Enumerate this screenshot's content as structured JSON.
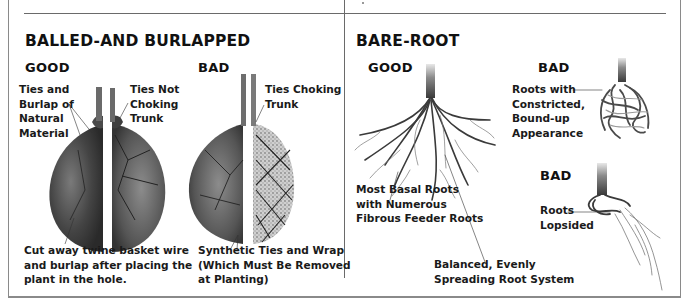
{
  "balled_and_burlapped": {
    "title": "BALLED-AND BURLAPPED",
    "good": {
      "heading": "GOOD",
      "label_natural": "Ties and\nBurlap of\nNatural\nMaterial",
      "label_not_choking": "Ties Not\nChoking\nTrunk",
      "instruction": "Cut away twine basket wire\nand burlap after placing the\nplant in the hole."
    },
    "bad": {
      "heading": "BAD",
      "label_choking": "Ties Choking\nTrunk",
      "label_synthetic": "Synthetic Ties and Wrap\n(Which Must Be Removed\nat Planting)"
    }
  },
  "bare_root": {
    "title": "BARE-ROOT",
    "good": {
      "heading": "GOOD",
      "label_basal": "Most Basal Roots\nwith Numerous\nFibrous Feeder Roots",
      "label_balanced": "Balanced, Evenly\nSpreading Root System"
    },
    "bad_bound": {
      "heading": "BAD",
      "label": "Roots with\nConstricted,\nBound-up\nAppearance"
    },
    "bad_lopsided": {
      "heading": "BAD",
      "label": "Roots\nLopsided"
    }
  },
  "colors": {
    "frame": "#8a8a8a",
    "rule": "#6a6a6a",
    "text": "#1a1a1a",
    "rootball_dark": "#3a3a3a",
    "rootball_mid": "#6b6b6b",
    "burlap_light": "#bdbdbd"
  }
}
